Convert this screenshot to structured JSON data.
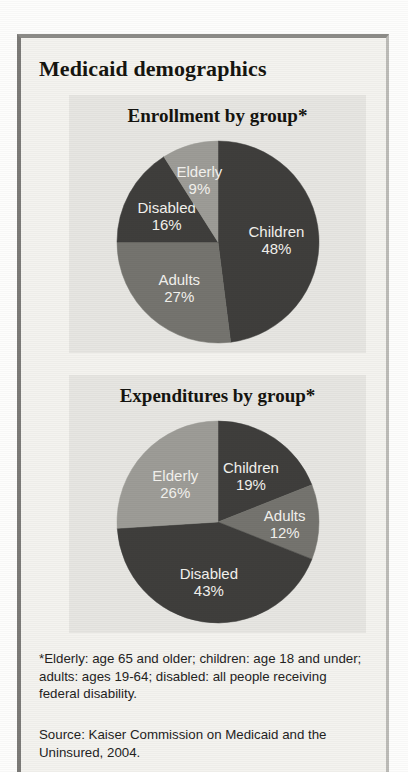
{
  "figure": {
    "title": "Medicaid demographics",
    "footnote": "*Elderly: age 65 and older; children: age 18 and under; adults: ages 19-64; disabled: all people receiving federal disability.",
    "source": "Source: Kaiser Commission on Medicaid and the Uninsured, 2004."
  },
  "colors": {
    "children": "#3f3e3c",
    "adults": "#75746f",
    "disabled": "#3f3e3c",
    "elderly": "#9d9c97",
    "panel_background": "#e7e6e2",
    "page_background": "#f4f3ef",
    "label_text": "#f3f2ee",
    "title_text": "#16150f"
  },
  "chart_data": [
    {
      "type": "pie",
      "id": "enrollment",
      "title": "Enrollment by group*",
      "categories": [
        "Children",
        "Adults",
        "Disabled",
        "Elderly"
      ],
      "values": [
        48,
        27,
        16,
        9
      ],
      "unit": "%",
      "labels": [
        "Children 48%",
        "Adults 27%",
        "Disabled 16%",
        "Elderly 9%"
      ],
      "slices": [
        {
          "label": "Children",
          "value": 48,
          "value_text": "48%",
          "color": "#3f3e3c"
        },
        {
          "label": "Adults",
          "value": 27,
          "value_text": "27%",
          "color": "#75746f"
        },
        {
          "label": "Disabled",
          "value": 16,
          "value_text": "16%",
          "color": "#3f3e3c"
        },
        {
          "label": "Elderly",
          "value": 9,
          "value_text": "9%",
          "color": "#9d9c97"
        }
      ],
      "start_angle": 0,
      "direction": "clockwise",
      "legend": "none",
      "data_labels": true
    },
    {
      "type": "pie",
      "id": "expenditures",
      "title": "Expenditures by group*",
      "categories": [
        "Children",
        "Adults",
        "Disabled",
        "Elderly"
      ],
      "values": [
        19,
        12,
        43,
        26
      ],
      "unit": "%",
      "labels": [
        "Children 19%",
        "Adults 12%",
        "Disabled 43%",
        "Elderly 26%"
      ],
      "slices": [
        {
          "label": "Children",
          "value": 19,
          "value_text": "19%",
          "color": "#3f3e3c"
        },
        {
          "label": "Adults",
          "value": 12,
          "value_text": "12%",
          "color": "#75746f"
        },
        {
          "label": "Disabled",
          "value": 43,
          "value_text": "43%",
          "color": "#3f3e3c"
        },
        {
          "label": "Elderly",
          "value": 26,
          "value_text": "26%",
          "color": "#9d9c97"
        }
      ],
      "start_angle": 0,
      "direction": "clockwise",
      "legend": "none",
      "data_labels": true
    }
  ]
}
